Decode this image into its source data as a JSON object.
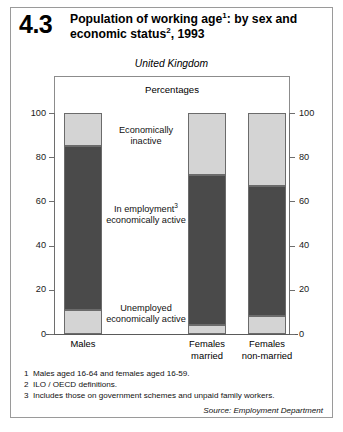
{
  "figure": {
    "number": "4.3",
    "title_line1": "Population of working age",
    "title_sup1": "1",
    "title_line1b": ": by sex",
    "title_line2": "and economic status",
    "title_sup2": "2",
    "title_line2b": ", 1993",
    "region": "United Kingdom",
    "units": "Percentages"
  },
  "chart_data": {
    "type": "bar",
    "subtitle": "United Kingdom",
    "ylabel": "Percentages",
    "xlabel": "",
    "ylim": [
      0,
      100
    ],
    "yticks": [
      0,
      20,
      40,
      60,
      80,
      100
    ],
    "ytick_labels": [
      "0",
      "20",
      "40",
      "60",
      "80",
      "100"
    ],
    "grid": false,
    "stacked": true,
    "dual_axis": true,
    "legend_position": "inline-annotations",
    "categories": [
      "Males",
      "Females married",
      "Females non-married"
    ],
    "category_labels": [
      {
        "line1": "Males",
        "line2": ""
      },
      {
        "line1": "Females",
        "line2": "married"
      },
      {
        "line1": "Females",
        "line2": "non-married"
      }
    ],
    "series": [
      {
        "name": "Unemployed economically active",
        "color": "#d4d4d4",
        "values": [
          11,
          4,
          8
        ]
      },
      {
        "name": "In employment economically active",
        "color": "#4a4a4a",
        "values": [
          74,
          68,
          59
        ]
      },
      {
        "name": "Economically inactive",
        "color": "#d4d4d4",
        "values": [
          15,
          28,
          33
        ]
      }
    ],
    "annotations": [
      {
        "label_line1": "Economically",
        "label_line2": "inactive",
        "sup": ""
      },
      {
        "label_line1": "In employment",
        "label_line2": "economically active",
        "sup": "3"
      },
      {
        "label_line1": "Unemployed",
        "label_line2": "economically active",
        "sup": ""
      }
    ]
  },
  "footnotes": [
    {
      "num": "1",
      "text": "Males aged 16-64 and females aged 16-59."
    },
    {
      "num": "2",
      "text": "ILO / OECD definitions."
    },
    {
      "num": "3",
      "text": "Includes those on government schemes and unpaid family workers."
    }
  ],
  "source": "Source: Employment Department",
  "colors": {
    "light_segment": "#d4d4d4",
    "dark_segment": "#4a4a4a",
    "frame": "#8c8c8c",
    "axis": "#6e6e6e"
  }
}
